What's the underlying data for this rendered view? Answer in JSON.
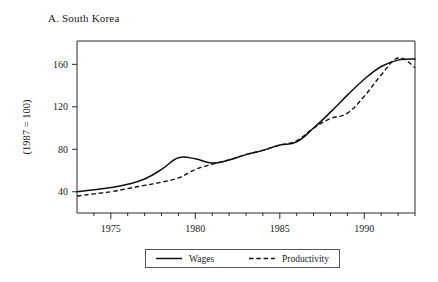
{
  "figure": {
    "panel_letter": "A.",
    "panel_title": "A.  South Korea",
    "ylabel": "(1987 = 100)"
  },
  "legend": {
    "position": "below-axes",
    "entries": [
      {
        "label": "Wages",
        "style": "solid"
      },
      {
        "label": "Productivity",
        "style": "dashed"
      }
    ]
  },
  "axis_labels": {
    "y": [
      "40",
      "80",
      "120",
      "160"
    ],
    "x": [
      "1975",
      "1980",
      "1985",
      "1990"
    ]
  },
  "chart_data": {
    "type": "line",
    "title": "A.  South Korea",
    "xlabel": "",
    "ylabel": "(1987 = 100)",
    "xlim": [
      1973,
      1993
    ],
    "ylim": [
      20,
      182
    ],
    "yticks": [
      40,
      80,
      120,
      160
    ],
    "xticks": [
      1975,
      1980,
      1985,
      1990
    ],
    "xminorticks": [
      1974,
      1976,
      1977,
      1978,
      1979,
      1981,
      1982,
      1983,
      1984,
      1986,
      1987,
      1988,
      1989,
      1991,
      1992,
      1993
    ],
    "grid": false,
    "legend_position": "below",
    "x": [
      1973,
      1974,
      1975,
      1976,
      1977,
      1978,
      1979,
      1980,
      1981,
      1982,
      1983,
      1984,
      1985,
      1986,
      1987,
      1988,
      1989,
      1990,
      1991,
      1992,
      1993
    ],
    "series": [
      {
        "name": "Wages",
        "style": "solid",
        "color": "#111111",
        "values": [
          40,
          42,
          44,
          47,
          52,
          61,
          72,
          71,
          67,
          70,
          75,
          79,
          84,
          87,
          100,
          115,
          131,
          146,
          158,
          164,
          165
        ]
      },
      {
        "name": "Productivity",
        "style": "dashed",
        "color": "#111111",
        "values": [
          36,
          38,
          40,
          43,
          46,
          49,
          53,
          61,
          66,
          70,
          75,
          79,
          84,
          88,
          100,
          109,
          114,
          130,
          150,
          166,
          157
        ]
      }
    ]
  }
}
